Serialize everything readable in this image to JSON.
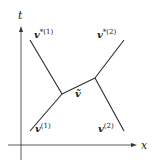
{
  "diagram": {
    "axes": {
      "horizontal_label": "x",
      "vertical_label": "t"
    },
    "labels": {
      "v_star_1": {
        "base": "v",
        "sup": "*(1)"
      },
      "v_star_2": {
        "base": "v",
        "sup": "*(2)"
      },
      "v_tilde": {
        "base": "ṽ"
      },
      "v_1": {
        "base": "v",
        "sup": "(1)"
      },
      "v_2": {
        "base": "v",
        "sup": "(2)"
      }
    },
    "colors": {
      "line": "#2a2a2a",
      "text": "#222222",
      "background": "#ffffff"
    }
  }
}
